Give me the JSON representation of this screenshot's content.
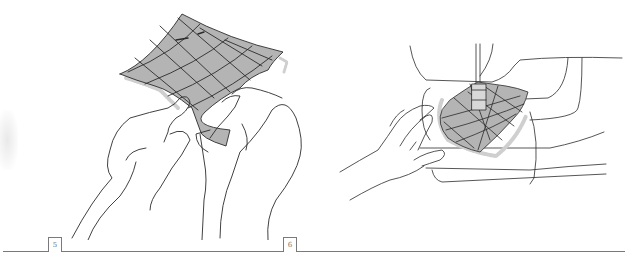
{
  "steps": [
    {
      "number": "5",
      "illustration": "hands-holding-quilted-fabric-square"
    },
    {
      "number": "6",
      "illustration": "hand-guiding-quilted-fabric-under-sewing-machine-presser-foot"
    }
  ],
  "colors": {
    "fabric_fill": "#b4b4b4",
    "line": "#2b2b2b",
    "rule": "#7a7a7a",
    "lace_edge": "#cfcfcf"
  }
}
